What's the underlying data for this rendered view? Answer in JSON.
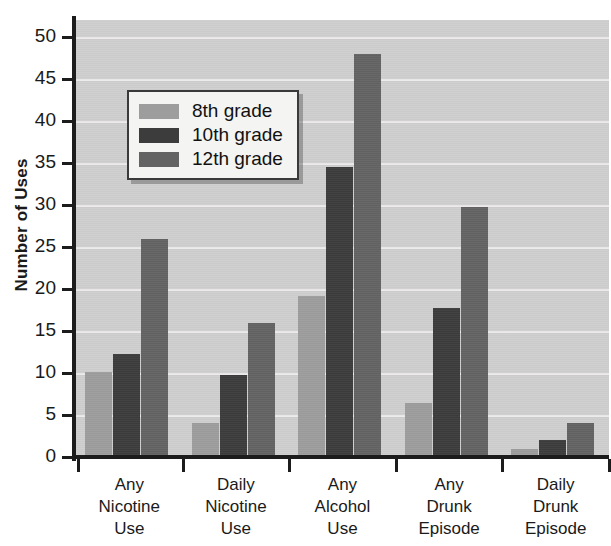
{
  "chart_data": {
    "type": "bar",
    "title": "",
    "xlabel": "",
    "ylabel": "Number of Uses",
    "ylim": [
      0,
      52
    ],
    "yticks": [
      0,
      5,
      10,
      15,
      20,
      25,
      30,
      35,
      40,
      45,
      50
    ],
    "grid": true,
    "legend_position": "upper-left-inside",
    "categories": [
      "Any Nicotine Use",
      "Daily Nicotine Use",
      "Any Alcohol Use",
      "Any Drunk Episode",
      "Daily Drunk Episode"
    ],
    "category_lines": [
      [
        "Any",
        "Nicotine",
        "Use"
      ],
      [
        "Daily",
        "Nicotine",
        "Use"
      ],
      [
        "Any",
        "Alcohol",
        "Use"
      ],
      [
        "Any",
        "Drunk",
        "Episode"
      ],
      [
        "Daily",
        "Drunk",
        "Episode"
      ]
    ],
    "series": [
      {
        "name": "8th grade",
        "color": "#9d9d9d",
        "values": [
          10.1,
          4.0,
          19.2,
          6.4,
          0.9
        ]
      },
      {
        "name": "10th grade",
        "color": "#3c3c3c",
        "values": [
          12.3,
          9.7,
          34.5,
          17.7,
          2.0
        ]
      },
      {
        "name": "12th grade",
        "color": "#636363",
        "values": [
          26.0,
          16.0,
          48.0,
          29.8,
          4.0
        ]
      }
    ]
  },
  "axis": {
    "y_title": "Number of Uses",
    "tick_labels": [
      "0",
      "5",
      "10",
      "15",
      "20",
      "25",
      "30",
      "35",
      "40",
      "45",
      "50"
    ]
  },
  "legend": {
    "entries": [
      {
        "label": "8th grade"
      },
      {
        "label": "10th grade"
      },
      {
        "label": "12th grade"
      }
    ]
  },
  "colors": {
    "grade8": "#9d9d9d",
    "grade10": "#3c3c3c",
    "grade12": "#636363",
    "plot_background": "#cfcfcf",
    "gridline": "#eceaea",
    "axis": "#1c1c1c"
  }
}
